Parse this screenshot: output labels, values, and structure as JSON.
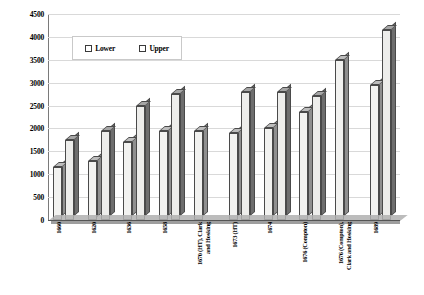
{
  "chart_data": {
    "type": "bar",
    "title": "",
    "xlabel": "",
    "ylabel": "",
    "ylim": [
      0,
      4500
    ],
    "ytick_step": 500,
    "yticks": [
      "0",
      "500",
      "1000",
      "1500",
      "2000",
      "2500",
      "3000",
      "3500",
      "4000",
      "4500"
    ],
    "grid": true,
    "legend_position": "top-left-inside",
    "legend": [
      "Lower",
      "Upper"
    ],
    "categories": [
      "1660",
      "1620",
      "1636",
      "1658",
      "1670 (HT), Clark\nand Hosking",
      "1673 (HT)",
      "1674",
      "1676 (Compton)",
      "1676 (Compton),\nClark and Hosking",
      "1689"
    ],
    "series": [
      {
        "name": "Lower",
        "values": [
          1150,
          1300,
          1700,
          1950,
          1950,
          1900,
          2000,
          2350,
          3500,
          2950
        ]
      },
      {
        "name": "Upper",
        "values": [
          1750,
          1950,
          2500,
          2750,
          1950,
          2800,
          2800,
          2700,
          3500,
          4150
        ]
      }
    ]
  },
  "colors": {
    "lower_front": "#f2f2f0",
    "lower_side": "#8f8f8f",
    "upper_front": "#ededeb",
    "upper_side": "#6e6e6e",
    "gridline": "#d9d9d9",
    "axis": "#555555"
  }
}
